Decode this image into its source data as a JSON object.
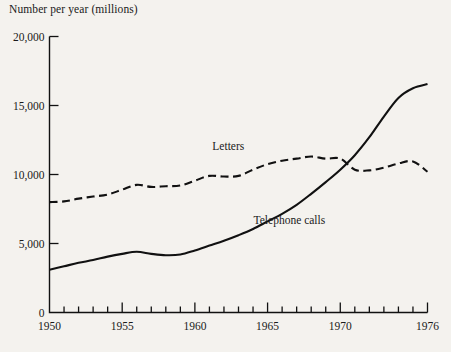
{
  "chart_data": {
    "type": "line",
    "title": "",
    "ylabel": "Number per year (millions)",
    "xlabel": "",
    "xlim": [
      1950,
      1976
    ],
    "ylim": [
      0,
      20000
    ],
    "grid": false,
    "legend_position": "inline-annotations",
    "x_tick_labels": [
      "1950",
      "1955",
      "1960",
      "1965",
      "1970",
      "1976"
    ],
    "x_tick_values": [
      1950,
      1955,
      1960,
      1965,
      1970,
      1976
    ],
    "x_minor_ticks": [
      1951,
      1952,
      1953,
      1954,
      1956,
      1957,
      1958,
      1959,
      1961,
      1962,
      1963,
      1964,
      1966,
      1967,
      1968,
      1969,
      1971,
      1972,
      1973,
      1974,
      1975
    ],
    "y_tick_labels": [
      "0",
      "5,000",
      "10,000",
      "15,000",
      "20,000"
    ],
    "y_tick_values": [
      0,
      5000,
      10000,
      15000,
      20000
    ],
    "x": [
      1950,
      1951,
      1952,
      1953,
      1954,
      1955,
      1956,
      1957,
      1958,
      1959,
      1960,
      1961,
      1962,
      1963,
      1964,
      1965,
      1966,
      1967,
      1968,
      1969,
      1970,
      1971,
      1972,
      1973,
      1974,
      1975,
      1976
    ],
    "series": [
      {
        "name": "Letters",
        "style": "dashed",
        "color": "#111111",
        "label_x": 1962.3,
        "label_y": 12050,
        "values": [
          8000,
          8050,
          8250,
          8400,
          8550,
          8900,
          9250,
          9100,
          9150,
          9200,
          9550,
          9900,
          9850,
          9900,
          10350,
          10750,
          11000,
          11150,
          11300,
          11150,
          11150,
          10350,
          10300,
          10500,
          10800,
          10950,
          10200
        ]
      },
      {
        "name": "Telephone calls",
        "style": "solid",
        "color": "#111111",
        "label_x": 1966.5,
        "label_y": 6700,
        "values": [
          3100,
          3350,
          3600,
          3800,
          4050,
          4250,
          4400,
          4250,
          4150,
          4200,
          4500,
          4850,
          5200,
          5600,
          6050,
          6600,
          7150,
          7800,
          8600,
          9450,
          10350,
          11400,
          12700,
          14200,
          15550,
          16250,
          16550
        ]
      }
    ]
  },
  "annotations": {
    "letters_label": "Letters",
    "telephone_label": "Telephone calls"
  },
  "colors": {
    "background": "#f4f2ee",
    "ink": "#111111"
  }
}
